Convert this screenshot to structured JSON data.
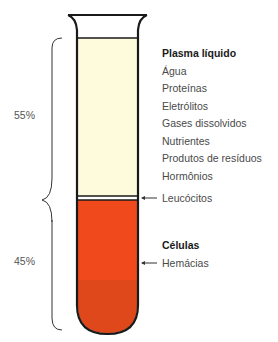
{
  "figure": {
    "percentages": {
      "plasma": "55%",
      "cells": "45%"
    },
    "plasma": {
      "heading": "Plasma líquido",
      "items": [
        "Água",
        "Proteínas",
        "Eletrólitos",
        "Gases dissolvidos",
        "Nutrientes",
        "Produtos de resíduos",
        "Hormônios"
      ]
    },
    "buffy_coat": {
      "label": "Leucócitos"
    },
    "cells": {
      "heading": "Células",
      "items": [
        "Hemácias"
      ]
    },
    "colors": {
      "plasma": "#fdfbdc",
      "cells_top": "#f0481c",
      "cells_bottom": "#d94416",
      "outline": "#1a1a1a"
    }
  }
}
